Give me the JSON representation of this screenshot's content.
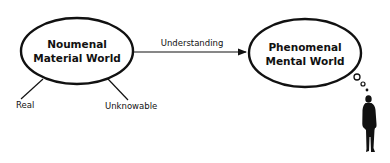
{
  "diagram": {
    "nodes": [
      {
        "id": "noumenal",
        "line1": "Noumenal",
        "line2": "Material World"
      },
      {
        "id": "phenomenal",
        "line1": "Phenomenal",
        "line2": "Mental World"
      }
    ],
    "edges": [
      {
        "from": "noumenal",
        "to": "phenomenal",
        "label": "Understanding"
      }
    ],
    "attributes": [
      {
        "of": "noumenal",
        "label": "Real"
      },
      {
        "of": "noumenal",
        "label": "Unknowable"
      }
    ],
    "figure": {
      "description": "person silhouette with thought bubbles",
      "thinks": "phenomenal"
    }
  },
  "colors": {
    "ink": "#111111",
    "background": "#ffffff"
  }
}
